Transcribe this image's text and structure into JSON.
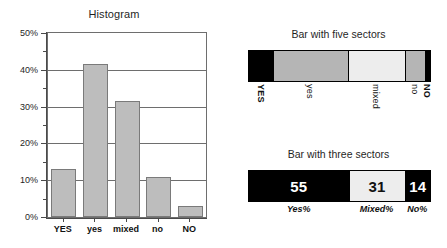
{
  "chart_data": [
    {
      "type": "bar",
      "title": "Histogram",
      "xlabel": "",
      "ylabel": "",
      "categories": [
        "YES",
        "yes",
        "mixed",
        "no",
        "NO"
      ],
      "values": [
        13,
        41.5,
        31.5,
        11,
        3
      ],
      "ylim": [
        0,
        50
      ],
      "ytick_labels": [
        "0%",
        "10%",
        "20%",
        "30%",
        "40%",
        "50%"
      ],
      "ytick_values": [
        0,
        10,
        20,
        30,
        40,
        50
      ],
      "yminor_values": [
        5,
        15,
        25,
        35,
        45
      ],
      "grid": true,
      "legend": "none",
      "bar_color": "#bdbdbd",
      "bar_edge_color": "#7a7a7a"
    },
    {
      "type": "bar",
      "orientation": "horizontal-stacked",
      "title": "Bar with five sectors",
      "categories": [
        "YES",
        "yes",
        "mixed",
        "no",
        "NO"
      ],
      "values": [
        13,
        41.5,
        31.5,
        11,
        3
      ],
      "colors": [
        "#000000",
        "#b5b5b5",
        "#ededed",
        "#b5b5b5",
        "#000000"
      ],
      "label_rotation": 90,
      "label_bold": [
        true,
        false,
        false,
        false,
        true
      ],
      "legend": "none"
    },
    {
      "type": "bar",
      "orientation": "horizontal-stacked",
      "title": "Bar with three sectors",
      "categories": [
        "Yes%",
        "Mixed%",
        "No%"
      ],
      "values": [
        55,
        31,
        14
      ],
      "value_labels": [
        "55",
        "31",
        "14"
      ],
      "colors": [
        "#000000",
        "#ededed",
        "#000000"
      ],
      "text_colors": [
        "#ffffff",
        "#111111",
        "#ffffff"
      ],
      "legend": "none"
    }
  ],
  "histogram": {
    "title": "Histogram",
    "y_ticks": [
      {
        "label": "50%",
        "value": 50
      },
      {
        "label": "40%",
        "value": 40
      },
      {
        "label": "30%",
        "value": 30
      },
      {
        "label": "20%",
        "value": 20
      },
      {
        "label": "10%",
        "value": 10
      },
      {
        "label": "0%",
        "value": 0
      }
    ],
    "bars": [
      {
        "label": "YES",
        "value": 13
      },
      {
        "label": "yes",
        "value": 41.5
      },
      {
        "label": "mixed",
        "value": 31.5
      },
      {
        "label": "no",
        "value": 11
      },
      {
        "label": "NO",
        "value": 3
      }
    ]
  },
  "five_sector": {
    "title": "Bar with five sectors",
    "sectors": [
      {
        "label": "YES",
        "value": 13,
        "color": "#000000",
        "bold": true
      },
      {
        "label": "yes",
        "value": 41.5,
        "color": "#b5b5b5",
        "bold": false
      },
      {
        "label": "mixed",
        "value": 31.5,
        "color": "#ededed",
        "bold": false
      },
      {
        "label": "no",
        "value": 11,
        "color": "#b5b5b5",
        "bold": false
      },
      {
        "label": "NO",
        "value": 3,
        "color": "#000000",
        "bold": true
      }
    ]
  },
  "three_sector": {
    "title": "Bar with three sectors",
    "sectors": [
      {
        "label": "Yes%",
        "value": 55,
        "display": "55",
        "color": "#000000",
        "text_color": "#ffffff"
      },
      {
        "label": "Mixed%",
        "value": 31,
        "display": "31",
        "color": "#ededed",
        "text_color": "#111111"
      },
      {
        "label": "No%",
        "value": 14,
        "display": "14",
        "color": "#000000",
        "text_color": "#ffffff"
      }
    ]
  }
}
